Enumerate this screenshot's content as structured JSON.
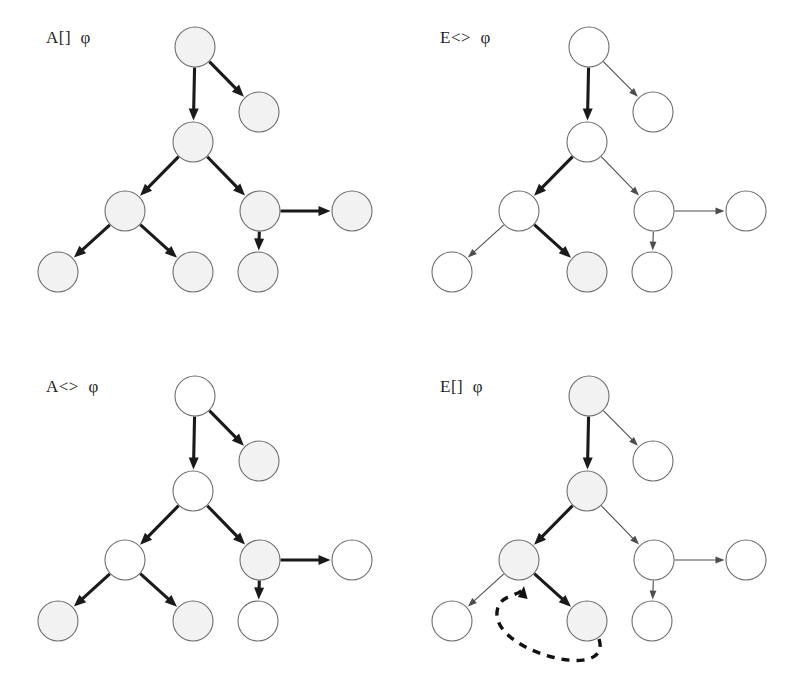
{
  "figure": {
    "width": 788,
    "height": 699,
    "background": "#ffffff"
  },
  "style": {
    "node_radius": 20,
    "node_fill_shaded": "#f2f2f2",
    "node_fill_plain": "#ffffff",
    "node_stroke": "#6e6e6e",
    "edge_bold_color": "#1a1a1a",
    "edge_thin_color": "#4d4d4d",
    "dashed_color": "#111111",
    "label_color": "#231f20"
  },
  "tree_layout": {
    "nodes": [
      {
        "id": "root",
        "cx": 195,
        "cy": 47
      },
      {
        "id": "n1",
        "cx": 193,
        "cy": 142
      },
      {
        "id": "n2",
        "cx": 259,
        "cy": 112
      },
      {
        "id": "n3",
        "cx": 125,
        "cy": 211
      },
      {
        "id": "n4",
        "cx": 260,
        "cy": 211
      },
      {
        "id": "n5",
        "cx": 58,
        "cy": 272
      },
      {
        "id": "n6",
        "cx": 193,
        "cy": 272
      },
      {
        "id": "n7",
        "cx": 352,
        "cy": 211
      },
      {
        "id": "n8",
        "cx": 258,
        "cy": 272
      }
    ],
    "edges": [
      {
        "from": "root",
        "to": "n1"
      },
      {
        "from": "root",
        "to": "n2"
      },
      {
        "from": "n1",
        "to": "n3"
      },
      {
        "from": "n1",
        "to": "n4"
      },
      {
        "from": "n3",
        "to": "n5"
      },
      {
        "from": "n3",
        "to": "n6"
      },
      {
        "from": "n4",
        "to": "n7"
      },
      {
        "from": "n4",
        "to": "n8"
      }
    ]
  },
  "panels": [
    {
      "key": "a-box",
      "label": "A[]  φ",
      "operator": "A[]",
      "formula": "φ",
      "meaning": "for All paths, Globally φ",
      "position": {
        "left": 0,
        "top": 0
      },
      "shaded_nodes": [
        "root",
        "n1",
        "n2",
        "n3",
        "n4",
        "n5",
        "n6",
        "n7",
        "n8"
      ],
      "bold_edges": [
        "root-n1",
        "root-n2",
        "n1-n3",
        "n1-n4",
        "n3-n5",
        "n3-n6",
        "n4-n7",
        "n4-n8"
      ],
      "dashed_loop": null
    },
    {
      "key": "e-diamond",
      "label": "E<>  φ",
      "operator": "E<>",
      "formula": "φ",
      "meaning": "there Exists a path where Eventually φ",
      "position": {
        "left": 394,
        "top": 0
      },
      "shaded_nodes": [
        "n6"
      ],
      "bold_edges": [
        "root-n1",
        "n1-n3",
        "n3-n6"
      ],
      "dashed_loop": null
    },
    {
      "key": "a-diamond",
      "label": "A<>  φ",
      "operator": "A<>",
      "formula": "φ",
      "meaning": "for All paths, Eventually φ",
      "position": {
        "left": 0,
        "top": 349
      },
      "shaded_nodes": [
        "n2",
        "n4",
        "n5",
        "n6"
      ],
      "bold_edges": [
        "root-n1",
        "root-n2",
        "n1-n3",
        "n1-n4",
        "n3-n5",
        "n3-n6",
        "n4-n7",
        "n4-n8"
      ],
      "dashed_loop": null
    },
    {
      "key": "e-box",
      "label": "E[]  φ",
      "operator": "E[]",
      "formula": "φ",
      "meaning": "there Exists a path where Globally φ",
      "position": {
        "left": 394,
        "top": 349
      },
      "shaded_nodes": [
        "root",
        "n1",
        "n3",
        "n6"
      ],
      "bold_edges": [
        "root-n1",
        "n1-n3",
        "n3-n6"
      ],
      "dashed_loop": {
        "from": "n6",
        "to": "n3",
        "style": "dashed",
        "direction": "back-edge"
      }
    }
  ]
}
